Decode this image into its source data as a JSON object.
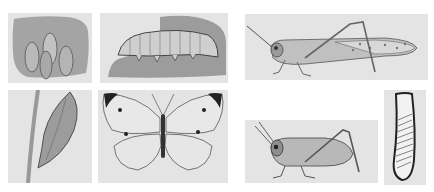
{
  "figure": {
    "background": "#ffffff",
    "panel_background": "#e4e4e4",
    "panels": [
      {
        "id": "eggs",
        "subject": "insect eggs",
        "caption": ""
      },
      {
        "id": "caterpillar",
        "subject": "caterpillar (larva)",
        "caption": ""
      },
      {
        "id": "grasshopper",
        "subject": "adult grasshopper",
        "caption": ""
      },
      {
        "id": "chrysalis",
        "subject": "chrysalis (pupa) on stem",
        "caption": ""
      },
      {
        "id": "butterfly",
        "subject": "adult white butterfly",
        "caption": ""
      },
      {
        "id": "nymph",
        "subject": "grasshopper nymph",
        "caption": ""
      },
      {
        "id": "egg-pod",
        "subject": "grasshopper egg pod",
        "caption": ""
      }
    ]
  }
}
